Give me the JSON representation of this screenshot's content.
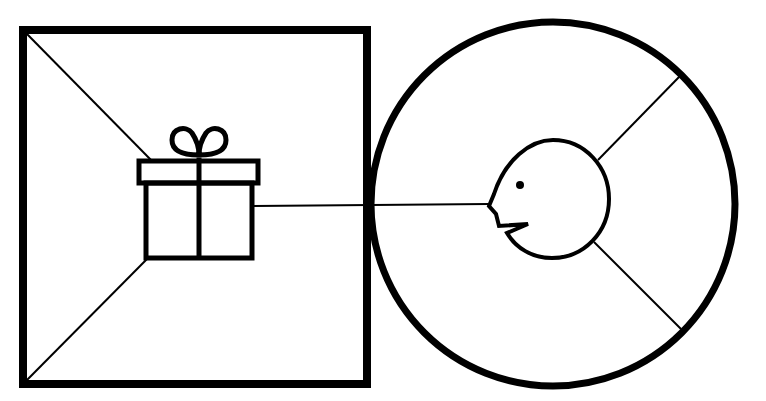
{
  "diagram": {
    "colors": {
      "stroke": "#000000",
      "background": "#ffffff"
    },
    "left_panel": {
      "shape": "square",
      "icon": "gift-icon"
    },
    "right_panel": {
      "shape": "circle",
      "icon": "face-profile-icon"
    },
    "connector": "line from gift box to face"
  }
}
